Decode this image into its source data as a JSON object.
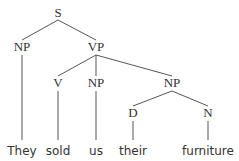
{
  "diagram": {
    "type": "syntax-tree",
    "sentence": "They sold us their furniture",
    "nodes": [
      {
        "id": "S",
        "label": "S",
        "kind": "category",
        "x": 58,
        "y": 17
      },
      {
        "id": "NP1",
        "label": "NP",
        "kind": "category",
        "x": 22,
        "y": 51
      },
      {
        "id": "VP",
        "label": "VP",
        "kind": "category",
        "x": 96,
        "y": 51
      },
      {
        "id": "V",
        "label": "V",
        "kind": "category",
        "x": 58,
        "y": 87
      },
      {
        "id": "NP2",
        "label": "NP",
        "kind": "category",
        "x": 96,
        "y": 87
      },
      {
        "id": "NP3",
        "label": "NP",
        "kind": "category",
        "x": 172,
        "y": 87
      },
      {
        "id": "D",
        "label": "D",
        "kind": "category",
        "x": 133,
        "y": 117
      },
      {
        "id": "N",
        "label": "N",
        "kind": "category",
        "x": 208,
        "y": 117
      },
      {
        "id": "W1",
        "label": "They",
        "kind": "word",
        "x": 22,
        "y": 155
      },
      {
        "id": "W2",
        "label": "sold",
        "kind": "word",
        "x": 58,
        "y": 155
      },
      {
        "id": "W3",
        "label": "us",
        "kind": "word",
        "x": 96,
        "y": 155
      },
      {
        "id": "W4",
        "label": "their",
        "kind": "word",
        "x": 133,
        "y": 155
      },
      {
        "id": "W5",
        "label": "furniture",
        "kind": "word",
        "x": 208,
        "y": 155
      }
    ],
    "edges": [
      {
        "from": "S",
        "to": "NP1",
        "x1": 58,
        "y1": 20,
        "x2": 22,
        "y2": 40
      },
      {
        "from": "S",
        "to": "VP",
        "x1": 58,
        "y1": 20,
        "x2": 96,
        "y2": 40
      },
      {
        "from": "NP1",
        "to": "W1",
        "x1": 22,
        "y1": 55,
        "x2": 22,
        "y2": 140
      },
      {
        "from": "VP",
        "to": "V",
        "x1": 96,
        "y1": 55,
        "x2": 58,
        "y2": 76
      },
      {
        "from": "VP",
        "to": "NP2",
        "x1": 96,
        "y1": 55,
        "x2": 96,
        "y2": 76
      },
      {
        "from": "VP",
        "to": "NP3",
        "x1": 96,
        "y1": 55,
        "x2": 172,
        "y2": 76
      },
      {
        "from": "V",
        "to": "W2",
        "x1": 58,
        "y1": 91,
        "x2": 58,
        "y2": 140
      },
      {
        "from": "NP2",
        "to": "W3",
        "x1": 96,
        "y1": 91,
        "x2": 96,
        "y2": 140
      },
      {
        "from": "NP3",
        "to": "D",
        "x1": 172,
        "y1": 91,
        "x2": 133,
        "y2": 106
      },
      {
        "from": "NP3",
        "to": "N",
        "x1": 172,
        "y1": 91,
        "x2": 208,
        "y2": 106
      },
      {
        "from": "D",
        "to": "W4",
        "x1": 133,
        "y1": 121,
        "x2": 133,
        "y2": 140
      },
      {
        "from": "N",
        "to": "W5",
        "x1": 208,
        "y1": 121,
        "x2": 208,
        "y2": 140
      }
    ]
  }
}
